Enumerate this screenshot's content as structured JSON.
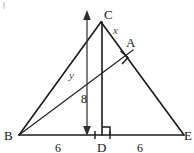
{
  "figure": {
    "type": "geometry-diagram",
    "background_color": "#ffffff",
    "line_color": "#1a1a1a",
    "label_color": "#141414",
    "variable_color": "#4a4a4a",
    "vertices": [
      {
        "name": "B",
        "label": "B",
        "x": 19,
        "y": 135,
        "label_x": 8,
        "label_y": 137
      },
      {
        "name": "C",
        "label": "C",
        "x": 101,
        "y": 22,
        "label_x": 105,
        "label_y": 18
      },
      {
        "name": "E",
        "label": "E",
        "x": 184,
        "y": 135,
        "label_x": 187,
        "label_y": 137
      },
      {
        "name": "D",
        "label": "D",
        "x": 102,
        "y": 135,
        "label_x": 99,
        "label_y": 149
      },
      {
        "name": "A",
        "label": "A",
        "x": 132,
        "y": 51,
        "label_x": 127,
        "label_y": 45
      }
    ],
    "segment_labels": [
      {
        "name": "base-left-measure",
        "label": "6",
        "x": 58,
        "y": 149
      },
      {
        "name": "base-right-measure",
        "label": "6",
        "x": 140,
        "y": 149
      },
      {
        "name": "altitude-measure",
        "label": "8",
        "x": 84,
        "y": 99
      }
    ],
    "variable_labels": [
      {
        "name": "side-ca-variable",
        "label": "x",
        "x": 116,
        "y": 31
      },
      {
        "name": "cevian-variable",
        "label": "y",
        "x": 72,
        "y": 76
      }
    ],
    "right_angles": [
      {
        "name": "right-angle-at-D",
        "x": 102,
        "y": 135,
        "size": 8
      },
      {
        "name": "right-angle-at-A",
        "x": 124,
        "y": 56,
        "size": 9
      }
    ],
    "annotations": {
      "altitude_arrow": "double-headed vertical arrow marking the height of 8",
      "tick_marks": "two small ticks on the base flanking point D"
    }
  }
}
